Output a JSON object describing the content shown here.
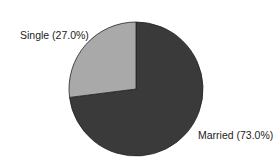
{
  "chart_data": {
    "type": "pie",
    "title": "",
    "categories": [
      "Married",
      "Single"
    ],
    "values": [
      73.0,
      27.0
    ],
    "labels": [
      "Married (73.0%)",
      "Single (27.0%)"
    ],
    "colors": [
      "#3a3a3a",
      "#a9a9a9"
    ],
    "start_angle_deg": 90,
    "direction": "clockwise"
  },
  "labels": {
    "married": "Married (73.0%)",
    "single": "Single (27.0%)"
  }
}
